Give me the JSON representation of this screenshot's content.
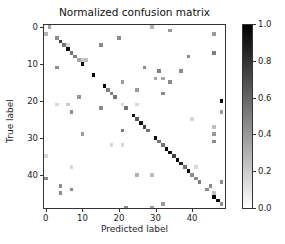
{
  "chart_data": {
    "type": "heatmap",
    "title": "Normalized confusion matrix",
    "xlabel": "Predicted label",
    "ylabel": "True label",
    "n_classes": 49,
    "x_ticks": [
      0,
      10,
      20,
      30,
      40
    ],
    "y_ticks": [
      0,
      10,
      20,
      30,
      40
    ],
    "colorbar": {
      "min": 0.0,
      "max": 1.0,
      "ticks": [
        "0.0",
        "0.2",
        "0.4",
        "0.6",
        "0.8",
        "1.0"
      ],
      "colormap": "Greys"
    },
    "cells": [
      [
        0,
        1,
        0.35
      ],
      [
        0,
        29,
        0.3
      ],
      [
        1,
        34,
        0.4
      ],
      [
        2,
        0,
        0.3
      ],
      [
        2,
        46,
        0.4
      ],
      [
        3,
        3,
        0.45
      ],
      [
        3,
        20,
        0.45
      ],
      [
        4,
        4,
        0.75
      ],
      [
        5,
        5,
        0.55
      ],
      [
        5,
        6,
        0.15
      ],
      [
        5,
        15,
        0.45
      ],
      [
        6,
        6,
        0.95
      ],
      [
        7,
        7,
        0.55
      ],
      [
        7,
        46,
        0.5
      ],
      [
        8,
        8,
        0.5
      ],
      [
        8,
        39,
        0.45
      ],
      [
        9,
        9,
        0.35
      ],
      [
        9,
        10,
        0.2
      ],
      [
        9,
        11,
        0.25
      ],
      [
        10,
        10,
        0.95
      ],
      [
        11,
        3,
        0.45
      ],
      [
        11,
        27,
        0.45
      ],
      [
        12,
        31,
        0.5
      ],
      [
        12,
        37,
        0.45
      ],
      [
        13,
        13,
        1.0
      ],
      [
        14,
        30,
        0.35
      ],
      [
        14,
        32,
        0.35
      ],
      [
        15,
        21,
        0.4
      ],
      [
        15,
        34,
        0.45
      ],
      [
        16,
        16,
        1.0
      ],
      [
        17,
        17,
        0.5
      ],
      [
        17,
        25,
        0.4
      ],
      [
        18,
        18,
        0.5
      ],
      [
        18,
        32,
        0.45
      ],
      [
        19,
        19,
        0.55
      ],
      [
        19,
        9,
        0.4
      ],
      [
        20,
        48,
        0.95
      ],
      [
        21,
        3,
        0.15
      ],
      [
        21,
        6,
        0.2
      ],
      [
        21,
        21,
        0.15
      ],
      [
        21,
        25,
        0.15
      ],
      [
        22,
        15,
        0.45
      ],
      [
        22,
        22,
        0.55
      ],
      [
        23,
        7,
        0.45
      ],
      [
        23,
        48,
        0.4
      ],
      [
        24,
        24,
        0.95
      ],
      [
        25,
        25,
        0.65
      ],
      [
        25,
        40,
        0.15
      ],
      [
        26,
        26,
        0.95
      ],
      [
        27,
        27,
        0.75
      ],
      [
        27,
        46,
        0.25
      ],
      [
        28,
        21,
        0.5
      ],
      [
        28,
        28,
        0.55
      ],
      [
        29,
        10,
        0.4
      ],
      [
        29,
        46,
        0.4
      ],
      [
        30,
        30,
        0.95
      ],
      [
        31,
        31,
        0.55
      ],
      [
        31,
        46,
        0.45
      ],
      [
        32,
        18,
        0.15
      ],
      [
        32,
        21,
        0.15
      ],
      [
        32,
        32,
        0.55
      ],
      [
        33,
        33,
        1.0
      ],
      [
        34,
        34,
        0.95
      ],
      [
        35,
        0,
        0.15
      ],
      [
        35,
        35,
        0.75
      ],
      [
        36,
        36,
        1.0
      ],
      [
        37,
        37,
        0.85
      ],
      [
        38,
        7,
        0.15
      ],
      [
        38,
        38,
        0.55
      ],
      [
        38,
        41,
        0.15
      ],
      [
        39,
        39,
        0.95
      ],
      [
        40,
        25,
        0.3
      ],
      [
        40,
        29,
        0.25
      ],
      [
        40,
        40,
        0.45
      ],
      [
        41,
        0,
        0.45
      ],
      [
        41,
        41,
        0.45
      ],
      [
        42,
        42,
        0.5
      ],
      [
        42,
        48,
        0.45
      ],
      [
        43,
        4,
        0.45
      ],
      [
        43,
        45,
        0.45
      ],
      [
        44,
        7,
        0.45
      ],
      [
        44,
        44,
        0.45
      ],
      [
        45,
        4,
        0.45
      ],
      [
        45,
        46,
        0.25
      ],
      [
        46,
        46,
        1.0
      ],
      [
        47,
        47,
        0.95
      ],
      [
        48,
        32,
        0.4
      ],
      [
        48,
        48,
        0.45
      ],
      [
        49,
        22,
        0.45
      ],
      [
        49,
        29,
        0.4
      ]
    ]
  }
}
